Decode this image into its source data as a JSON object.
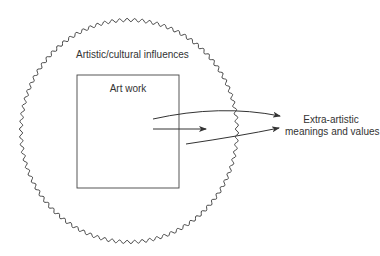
{
  "diagram": {
    "outer_region": {
      "label": "Artistic/cultural influences",
      "shape": "wavy-circle"
    },
    "inner_box": {
      "label": "Art work",
      "shape": "rectangle"
    },
    "target": {
      "label_line1": "Extra-artistic",
      "label_line2": "meanings and values"
    },
    "arrows": [
      {
        "from": "Art work",
        "to": "Extra-artistic meanings and values",
        "style": "curved-up"
      },
      {
        "from": "Art work",
        "to": "Art work boundary",
        "style": "straight-short"
      },
      {
        "from": "Art work",
        "to": "Extra-artistic meanings and values",
        "style": "curved-low"
      }
    ],
    "colors": {
      "stroke": "#333333",
      "background": "#ffffff"
    }
  }
}
